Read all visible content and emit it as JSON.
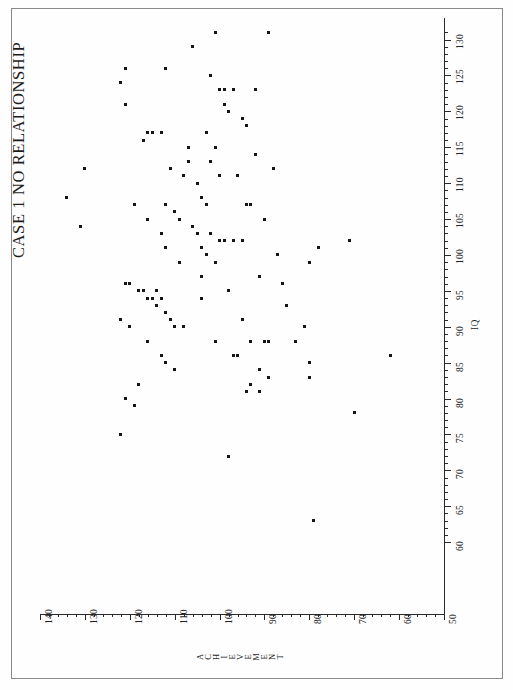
{
  "figure": {
    "title": "CASE 1  NO  RELATIONSHIP",
    "background_color": "#fefefe",
    "ink_color": "#151515"
  },
  "chart_data": {
    "type": "scatter",
    "title": "CASE 1  NO  RELATIONSHIP",
    "orientation": "rotated-90-ccw",
    "xlabel": "ACHIEVEMENT",
    "ylabel": "IQ",
    "grid": false,
    "legend": null,
    "xlim": [
      50,
      140
    ],
    "ylim": [
      60,
      130
    ],
    "x_axis_name": "ACHIEVEMENT",
    "y_axis_name": "IQ",
    "x_tick_labels": [
      "140",
      "130",
      "120",
      "110",
      "100",
      "90",
      "80",
      "70",
      "60",
      "50"
    ],
    "x_tick_values": [
      140,
      130,
      120,
      110,
      100,
      90,
      80,
      70,
      60,
      50
    ],
    "y_tick_labels": [
      "60",
      "65",
      "70",
      "75",
      "80",
      "85",
      "90",
      "95",
      "100",
      "105",
      "110",
      "115",
      "120",
      "125",
      "130"
    ],
    "y_tick_values": [
      60,
      65,
      70,
      75,
      80,
      85,
      90,
      95,
      100,
      105,
      110,
      115,
      120,
      125,
      130
    ],
    "x_minor_tick_interval": 2,
    "y_minor_tick_interval": 1,
    "n_points": 111,
    "correlation": "none",
    "points": [
      {
        "achievement": 101,
        "iq": 131
      },
      {
        "achievement": 89,
        "iq": 131
      },
      {
        "achievement": 121,
        "iq": 126
      },
      {
        "achievement": 112,
        "iq": 126
      },
      {
        "achievement": 122,
        "iq": 124
      },
      {
        "achievement": 102,
        "iq": 125
      },
      {
        "achievement": 100,
        "iq": 123
      },
      {
        "achievement": 99,
        "iq": 123
      },
      {
        "achievement": 97,
        "iq": 123
      },
      {
        "achievement": 92,
        "iq": 123
      },
      {
        "achievement": 121,
        "iq": 121
      },
      {
        "achievement": 99,
        "iq": 121
      },
      {
        "achievement": 98,
        "iq": 120
      },
      {
        "achievement": 95,
        "iq": 119
      },
      {
        "achievement": 116,
        "iq": 117
      },
      {
        "achievement": 115,
        "iq": 117
      },
      {
        "achievement": 113,
        "iq": 117
      },
      {
        "achievement": 103,
        "iq": 117
      },
      {
        "achievement": 94,
        "iq": 118
      },
      {
        "achievement": 117,
        "iq": 116
      },
      {
        "achievement": 107,
        "iq": 115
      },
      {
        "achievement": 101,
        "iq": 115
      },
      {
        "achievement": 92,
        "iq": 114
      },
      {
        "achievement": 130,
        "iq": 112
      },
      {
        "achievement": 111,
        "iq": 112
      },
      {
        "achievement": 108,
        "iq": 111
      },
      {
        "achievement": 100,
        "iq": 111
      },
      {
        "achievement": 96,
        "iq": 111
      },
      {
        "achievement": 134,
        "iq": 108
      },
      {
        "achievement": 119,
        "iq": 107
      },
      {
        "achievement": 112,
        "iq": 107
      },
      {
        "achievement": 110,
        "iq": 106
      },
      {
        "achievement": 104,
        "iq": 108
      },
      {
        "achievement": 103,
        "iq": 107
      },
      {
        "achievement": 94,
        "iq": 107
      },
      {
        "achievement": 93,
        "iq": 107
      },
      {
        "achievement": 116,
        "iq": 105
      },
      {
        "achievement": 109,
        "iq": 105
      },
      {
        "achievement": 106,
        "iq": 104
      },
      {
        "achievement": 131,
        "iq": 104
      },
      {
        "achievement": 113,
        "iq": 103
      },
      {
        "achievement": 105,
        "iq": 103
      },
      {
        "achievement": 102,
        "iq": 103
      },
      {
        "achievement": 100,
        "iq": 102
      },
      {
        "achievement": 99,
        "iq": 102
      },
      {
        "achievement": 97,
        "iq": 102
      },
      {
        "achievement": 95,
        "iq": 102
      },
      {
        "achievement": 112,
        "iq": 101
      },
      {
        "achievement": 104,
        "iq": 101
      },
      {
        "achievement": 103,
        "iq": 100
      },
      {
        "achievement": 71,
        "iq": 102
      },
      {
        "achievement": 78,
        "iq": 101
      },
      {
        "achievement": 109,
        "iq": 99
      },
      {
        "achievement": 101,
        "iq": 99
      },
      {
        "achievement": 80,
        "iq": 99
      },
      {
        "achievement": 104,
        "iq": 97
      },
      {
        "achievement": 91,
        "iq": 97
      },
      {
        "achievement": 121,
        "iq": 96
      },
      {
        "achievement": 120,
        "iq": 96
      },
      {
        "achievement": 118,
        "iq": 95
      },
      {
        "achievement": 117,
        "iq": 95
      },
      {
        "achievement": 116,
        "iq": 94
      },
      {
        "achievement": 115,
        "iq": 94
      },
      {
        "achievement": 114,
        "iq": 95
      },
      {
        "achievement": 114,
        "iq": 93
      },
      {
        "achievement": 113,
        "iq": 94
      },
      {
        "achievement": 104,
        "iq": 94
      },
      {
        "achievement": 98,
        "iq": 95
      },
      {
        "achievement": 112,
        "iq": 92
      },
      {
        "achievement": 122,
        "iq": 91
      },
      {
        "achievement": 111,
        "iq": 91
      },
      {
        "achievement": 120,
        "iq": 90
      },
      {
        "achievement": 110,
        "iq": 90
      },
      {
        "achievement": 108,
        "iq": 90
      },
      {
        "achievement": 95,
        "iq": 91
      },
      {
        "achievement": 81,
        "iq": 90
      },
      {
        "achievement": 116,
        "iq": 88
      },
      {
        "achievement": 101,
        "iq": 88
      },
      {
        "achievement": 93,
        "iq": 88
      },
      {
        "achievement": 90,
        "iq": 88
      },
      {
        "achievement": 89,
        "iq": 88
      },
      {
        "achievement": 113,
        "iq": 86
      },
      {
        "achievement": 112,
        "iq": 85
      },
      {
        "achievement": 96,
        "iq": 86
      },
      {
        "achievement": 62,
        "iq": 86
      },
      {
        "achievement": 80,
        "iq": 85
      },
      {
        "achievement": 110,
        "iq": 84
      },
      {
        "achievement": 91,
        "iq": 84
      },
      {
        "achievement": 89,
        "iq": 83
      },
      {
        "achievement": 118,
        "iq": 82
      },
      {
        "achievement": 93,
        "iq": 82
      },
      {
        "achievement": 91,
        "iq": 81
      },
      {
        "achievement": 80,
        "iq": 83
      },
      {
        "achievement": 121,
        "iq": 80
      },
      {
        "achievement": 119,
        "iq": 79
      },
      {
        "achievement": 70,
        "iq": 78
      },
      {
        "achievement": 122,
        "iq": 75
      },
      {
        "achievement": 98,
        "iq": 72
      },
      {
        "achievement": 79,
        "iq": 63
      },
      {
        "achievement": 106,
        "iq": 129
      },
      {
        "achievement": 107,
        "iq": 113
      },
      {
        "achievement": 105,
        "iq": 110
      },
      {
        "achievement": 102,
        "iq": 113
      },
      {
        "achievement": 90,
        "iq": 105
      },
      {
        "achievement": 88,
        "iq": 112
      },
      {
        "achievement": 87,
        "iq": 100
      },
      {
        "achievement": 86,
        "iq": 96
      },
      {
        "achievement": 85,
        "iq": 93
      },
      {
        "achievement": 97,
        "iq": 86
      },
      {
        "achievement": 94,
        "iq": 81
      },
      {
        "achievement": 83,
        "iq": 88
      }
    ]
  }
}
